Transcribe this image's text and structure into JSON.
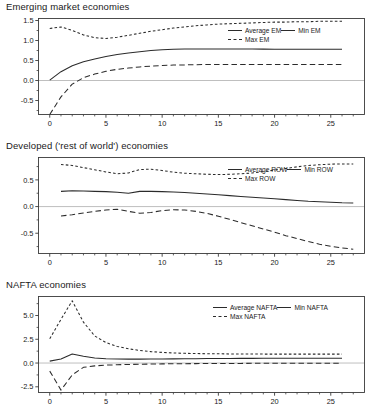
{
  "chart_data": [
    {
      "type": "line",
      "title": "Emerging market economies",
      "xlabel": "",
      "ylabel": "",
      "xlim": [
        -1,
        28
      ],
      "ylim": [
        -0.85,
        1.55
      ],
      "xticks": [
        0,
        5,
        10,
        15,
        20,
        25
      ],
      "yticks": [
        -0.5,
        0.0,
        0.5,
        1.0,
        1.5
      ],
      "ytick_labels": [
        "-0.5",
        "0.0",
        "0.5",
        "1.0",
        "1.5"
      ],
      "xtick_labels": [
        "0",
        "5",
        "10",
        "15",
        "20",
        "25"
      ],
      "grid": false,
      "zero_line": true,
      "legend_position": "top-right",
      "x": [
        0,
        1,
        2,
        3,
        4,
        5,
        6,
        7,
        8,
        9,
        10,
        11,
        12,
        13,
        14,
        15,
        16,
        17,
        18,
        19,
        20,
        21,
        22,
        23,
        24,
        25,
        26
      ],
      "series": [
        {
          "name": "Average EM",
          "style": "solid",
          "values": [
            0.01,
            0.22,
            0.37,
            0.47,
            0.54,
            0.6,
            0.65,
            0.69,
            0.72,
            0.75,
            0.77,
            0.78,
            0.785,
            0.79,
            0.79,
            0.79,
            0.79,
            0.79,
            0.785,
            0.785,
            0.78,
            0.78,
            0.78,
            0.78,
            0.78,
            0.78,
            0.78
          ]
        },
        {
          "name": "Min EM",
          "style": "dashed",
          "values": [
            -0.85,
            -0.41,
            -0.09,
            0.07,
            0.16,
            0.23,
            0.28,
            0.31,
            0.34,
            0.36,
            0.375,
            0.385,
            0.39,
            0.395,
            0.4,
            0.4,
            0.4,
            0.4,
            0.4,
            0.4,
            0.4,
            0.4,
            0.4,
            0.4,
            0.4,
            0.4,
            0.4
          ]
        },
        {
          "name": "Max EM",
          "style": "dotted",
          "values": [
            1.3,
            1.34,
            1.25,
            1.14,
            1.07,
            1.05,
            1.08,
            1.13,
            1.18,
            1.23,
            1.27,
            1.31,
            1.34,
            1.37,
            1.39,
            1.41,
            1.42,
            1.43,
            1.44,
            1.45,
            1.46,
            1.46,
            1.47,
            1.47,
            1.48,
            1.48,
            1.48
          ]
        }
      ]
    },
    {
      "type": "line",
      "title": "Developed ('rest of world') economies",
      "xlabel": "",
      "ylabel": "",
      "xlim": [
        -1,
        28
      ],
      "ylim": [
        -0.88,
        0.92
      ],
      "xticks": [
        0,
        5,
        10,
        15,
        20,
        25
      ],
      "yticks": [
        -0.5,
        0.0,
        0.5
      ],
      "ytick_labels": [
        "-0.5",
        "0.0",
        "0.5"
      ],
      "xtick_labels": [
        "0",
        "5",
        "10",
        "15",
        "20",
        "25"
      ],
      "grid": false,
      "zero_line": true,
      "legend_position": "top-right",
      "x": [
        1,
        2,
        3,
        4,
        5,
        6,
        7,
        8,
        9,
        10,
        11,
        12,
        13,
        14,
        15,
        16,
        17,
        18,
        19,
        20,
        21,
        22,
        23,
        24,
        25,
        26,
        27
      ],
      "series": [
        {
          "name": "Average ROW",
          "style": "solid",
          "values": [
            0.285,
            0.295,
            0.29,
            0.285,
            0.28,
            0.27,
            0.25,
            0.285,
            0.285,
            0.28,
            0.275,
            0.265,
            0.25,
            0.235,
            0.22,
            0.205,
            0.19,
            0.175,
            0.16,
            0.145,
            0.13,
            0.115,
            0.1,
            0.09,
            0.08,
            0.07,
            0.065
          ]
        },
        {
          "name": "Min ROW",
          "style": "dashed",
          "values": [
            -0.175,
            -0.155,
            -0.12,
            -0.09,
            -0.065,
            -0.05,
            -0.09,
            -0.125,
            -0.11,
            -0.075,
            -0.06,
            -0.065,
            -0.09,
            -0.13,
            -0.18,
            -0.24,
            -0.3,
            -0.36,
            -0.42,
            -0.48,
            -0.545,
            -0.6,
            -0.655,
            -0.705,
            -0.745,
            -0.775,
            -0.8
          ]
        },
        {
          "name": "Max ROW",
          "style": "dotted",
          "values": [
            0.79,
            0.77,
            0.73,
            0.69,
            0.65,
            0.615,
            0.63,
            0.695,
            0.7,
            0.675,
            0.645,
            0.625,
            0.615,
            0.605,
            0.6,
            0.605,
            0.615,
            0.63,
            0.655,
            0.685,
            0.715,
            0.745,
            0.77,
            0.785,
            0.795,
            0.8,
            0.8
          ]
        }
      ]
    },
    {
      "type": "line",
      "title": "NAFTA economies",
      "xlabel": "",
      "ylabel": "",
      "xlim": [
        -1,
        28
      ],
      "ylim": [
        -3.1,
        7.0
      ],
      "xticks": [
        0,
        5,
        10,
        15,
        20,
        25
      ],
      "yticks": [
        -2.5,
        0.0,
        2.5,
        5.0
      ],
      "ytick_labels": [
        "-2.5",
        "0.0",
        "2.5",
        "5.0"
      ],
      "xtick_labels": [
        "0",
        "5",
        "10",
        "15",
        "20",
        "25"
      ],
      "grid": false,
      "zero_line": true,
      "legend_position": "top-right",
      "x": [
        0,
        1,
        2,
        3,
        4,
        5,
        6,
        7,
        8,
        9,
        10,
        11,
        12,
        13,
        14,
        15,
        16,
        17,
        18,
        19,
        20,
        21,
        22,
        23,
        24,
        25,
        26
      ],
      "series": [
        {
          "name": "Average NAFTA",
          "style": "solid",
          "values": [
            0.2,
            0.42,
            0.95,
            0.72,
            0.52,
            0.45,
            0.42,
            0.41,
            0.41,
            0.42,
            0.43,
            0.44,
            0.45,
            0.46,
            0.47,
            0.48,
            0.48,
            0.49,
            0.49,
            0.5,
            0.5,
            0.5,
            0.5,
            0.5,
            0.5,
            0.5,
            0.5
          ]
        },
        {
          "name": "Min NAFTA",
          "style": "dashed",
          "values": [
            -0.85,
            -2.85,
            -1.25,
            -0.45,
            -0.3,
            -0.22,
            -0.18,
            -0.15,
            -0.13,
            -0.11,
            -0.09,
            -0.08,
            -0.07,
            -0.06,
            -0.05,
            -0.05,
            -0.04,
            -0.04,
            -0.03,
            -0.03,
            -0.03,
            -0.02,
            -0.02,
            -0.02,
            -0.02,
            -0.02,
            -0.02
          ]
        },
        {
          "name": "Max NAFTA",
          "style": "dotted",
          "values": [
            2.55,
            4.6,
            6.55,
            4.3,
            2.85,
            2.15,
            1.75,
            1.5,
            1.32,
            1.2,
            1.12,
            1.06,
            1.02,
            1.0,
            0.98,
            0.97,
            0.96,
            0.95,
            0.95,
            0.94,
            0.94,
            0.94,
            0.94,
            0.94,
            0.94,
            0.94,
            0.94
          ]
        }
      ]
    }
  ],
  "colors": {
    "line": "#2b2b2b",
    "axis": "#3a3a3a",
    "zero_line": "#b8b8b8",
    "text": "#1a1a1a",
    "background": "#ffffff"
  }
}
